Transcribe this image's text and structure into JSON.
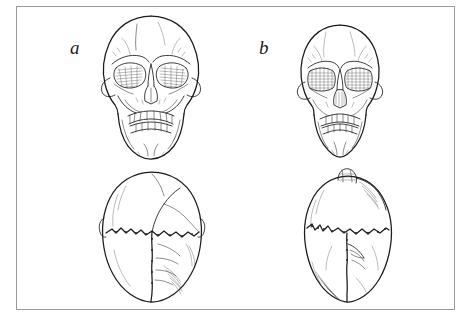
{
  "plate": {
    "background_color": "#ffffff",
    "frame_color": "#9a9a9a",
    "ink_color": "#1b1b1b",
    "medium": "pen-and-ink line drawing",
    "subject": "comparative human skull illustration plate"
  },
  "figures": [
    {
      "label": "a",
      "views": [
        {
          "name": "frontal",
          "caption": ""
        },
        {
          "name": "superior",
          "caption": ""
        }
      ]
    },
    {
      "label": "b",
      "views": [
        {
          "name": "frontal",
          "caption": ""
        },
        {
          "name": "superior",
          "caption": ""
        }
      ]
    }
  ],
  "labels": {
    "figure_a": "a",
    "figure_b": "b"
  }
}
